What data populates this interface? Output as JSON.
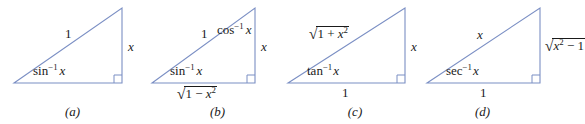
{
  "figure": {
    "background_color": "#ffffff",
    "line_color": "#7b8fc4",
    "text_color": "#1a1a1a"
  },
  "panels": [
    {
      "id": "a",
      "caption": "(a)",
      "hypotenuse_label": "1",
      "opposite_label": "x",
      "adjacent_label": "",
      "angle_label_fn": "sin",
      "angle_label_exp": "−1",
      "angle_label_arg": "x",
      "angle_label_plain": "sin⁻¹ x"
    },
    {
      "id": "b",
      "caption": "(b)",
      "hypotenuse_label": "1",
      "opposite_label": "x",
      "adjacent_label": "√(1 − x²)",
      "adjacent_radicand_base": "1 − x",
      "adjacent_radicand_exp": "2",
      "angle_label_fn": "sin",
      "angle_label_exp": "−1",
      "angle_label_arg": "x",
      "angle_label_plain": "sin⁻¹ x",
      "top_angle_fn": "cos",
      "top_angle_exp": "−1",
      "top_angle_arg": "x",
      "top_angle_plain": "cos⁻¹ x"
    },
    {
      "id": "c",
      "caption": "(c)",
      "hypotenuse_label": "√(1 + x²)",
      "hypotenuse_radicand_base": "1 + x",
      "hypotenuse_radicand_exp": "2",
      "opposite_label": "x",
      "adjacent_label": "1",
      "angle_label_fn": "tan",
      "angle_label_exp": "−1",
      "angle_label_arg": "x",
      "angle_label_plain": "tan⁻¹ x"
    },
    {
      "id": "d",
      "caption": "(d)",
      "hypotenuse_label": "x",
      "opposite_label": "√(x² − 1)",
      "opposite_radicand_base": "x",
      "opposite_radicand_exp": "2",
      "opposite_radicand_tail": " − 1",
      "adjacent_label": "1",
      "angle_label_fn": "sec",
      "angle_label_exp": "−1",
      "angle_label_arg": "x",
      "angle_label_plain": "sec⁻¹ x"
    }
  ]
}
